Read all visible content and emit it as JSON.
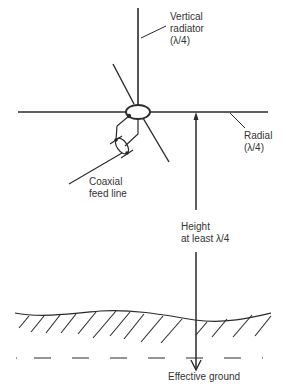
{
  "diagram": {
    "labels": {
      "vertical_radiator": [
        "Vertical",
        "radiator",
        "(λ/4)"
      ],
      "radial": [
        "Radial",
        "(λ/4)"
      ],
      "coaxial_feed": [
        "Coaxial",
        "feed line"
      ],
      "height": [
        "Height",
        "at least λ/4"
      ],
      "effective_ground": "Effective ground"
    },
    "colors": {
      "line": "#2a2a2a",
      "text": "#333333",
      "background": "#ffffff"
    }
  }
}
